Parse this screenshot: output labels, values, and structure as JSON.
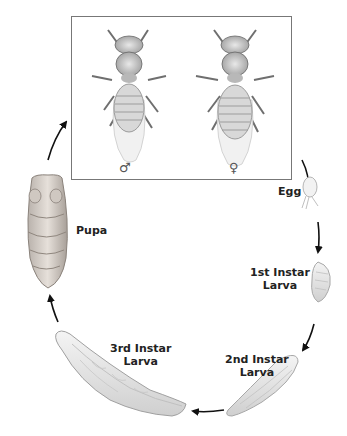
{
  "diagram": {
    "adults": {
      "male": {
        "symbol": "♂"
      },
      "female": {
        "symbol": "♀"
      }
    },
    "stages": [
      {
        "id": "egg",
        "label": "Egg"
      },
      {
        "id": "first-instar",
        "label_line1": "1st Instar",
        "label_line2": "Larva"
      },
      {
        "id": "second-instar",
        "label_line1": "2nd Instar",
        "label_line2": "Larva"
      },
      {
        "id": "third-instar",
        "label_line1": "3rd Instar",
        "label_line2": "Larva"
      },
      {
        "id": "pupa",
        "label": "Pupa"
      }
    ],
    "colors": {
      "arrow": "#111111",
      "box_border": "#777777",
      "label": "#222222"
    }
  }
}
